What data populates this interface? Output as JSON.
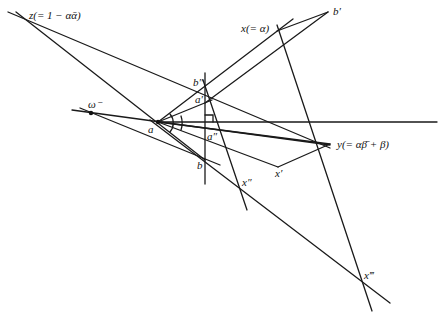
{
  "diagram": {
    "type": "geometric-construction",
    "labels": {
      "z": "z(= 1 − αᾱ)",
      "x": "x(= α)",
      "b_prime": "b′",
      "b_double": "b″",
      "a_prime": "a′",
      "omega": "ω⁻",
      "a": "a",
      "a_double": "a″",
      "y": "y(= αβ̄ + β)",
      "b": "b",
      "x_prime": "x′",
      "x_double": "x″",
      "x_triple": "x‴"
    },
    "points": {
      "z": [
        20,
        18
      ],
      "x": [
        277,
        29
      ],
      "b_prime": [
        328,
        12
      ],
      "b_double": [
        205,
        85
      ],
      "a_prime": [
        212,
        98
      ],
      "omega": [
        91,
        113
      ],
      "a": [
        158,
        122
      ],
      "a_double": [
        207,
        135
      ],
      "y": [
        330,
        144
      ],
      "b": [
        204,
        160
      ],
      "x_prime": [
        278,
        167
      ],
      "x_double": [
        240,
        186
      ],
      "x_triple": [
        363,
        281
      ]
    },
    "colors": {
      "line": "#1a1a1a",
      "background": "#ffffff"
    }
  }
}
